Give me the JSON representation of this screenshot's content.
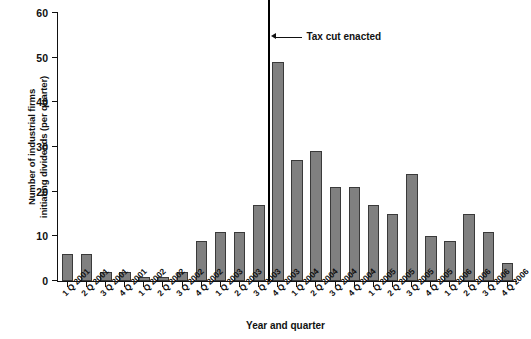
{
  "chart_data": {
    "type": "bar",
    "title": "",
    "xlabel": "Year and quarter",
    "ylabel_line1": "Number of industrial firms",
    "ylabel_line2": "initiating dividends (per quarter)",
    "ylim": [
      0,
      60
    ],
    "yticks": [
      0,
      10,
      20,
      30,
      40,
      50,
      60
    ],
    "grid": false,
    "legend": null,
    "bar_color": "#808080",
    "bar_edge_color": "#3a3a3a",
    "categories": [
      "1 Q 2001",
      "2 Q 2001",
      "3 Q 2001",
      "4 Q 2001",
      "1 Q 2002",
      "2 Q 2002",
      "3 Q 2002",
      "4 Q 2002",
      "1 Q 2003",
      "2 Q 2003",
      "3 Q 2003",
      "4 Q 2003",
      "1 Q 2004",
      "2 Q 2004",
      "3 Q 2004",
      "4 Q 2004",
      "1 Q 2005",
      "2 Q 2005",
      "3 Q 2005",
      "4 Q 2005",
      "1 Q 2006",
      "2 Q 2006",
      "3 Q 2006",
      "4 Q 2006"
    ],
    "values": [
      6,
      6,
      2,
      2,
      1,
      1,
      2,
      9,
      11,
      11,
      17,
      49,
      27,
      29,
      21,
      21,
      17,
      15,
      24,
      10,
      9,
      15,
      11,
      4
    ],
    "annotations": [
      {
        "text": "Tax cut enacted",
        "marker": "vertical-line",
        "between": [
          "3 Q 2003",
          "4 Q 2003"
        ],
        "index_after": 11
      }
    ]
  }
}
